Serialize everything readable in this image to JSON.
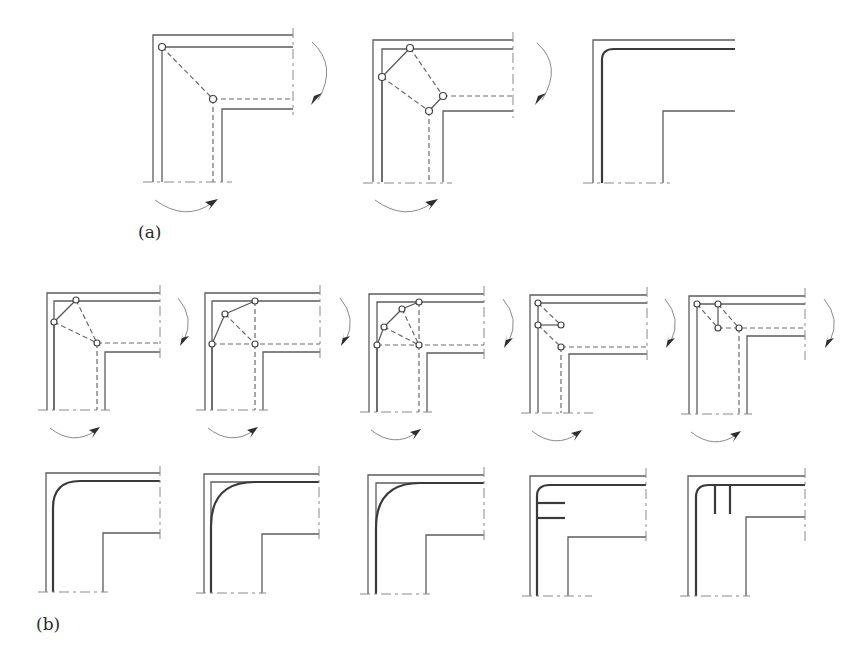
{
  "figure": {
    "labels": {
      "a": "(a)",
      "b": "(b)"
    },
    "colors": {
      "line": "#5c5c5c",
      "bold_line": "#3a3a3a",
      "background": "#ffffff"
    },
    "row_a": {
      "panels": [
        {
          "id": "a1",
          "type": "mechanism",
          "nodes": 2,
          "description": "single pivot linkage from outer corner to inner corner"
        },
        {
          "id": "a2",
          "type": "mechanism",
          "nodes": 4,
          "description": "four-node linkage around corner"
        },
        {
          "id": "a3",
          "type": "result",
          "description": "rounded corner profile"
        }
      ]
    },
    "row_b": {
      "mechanisms": [
        {
          "id": "b1",
          "nodes": 3
        },
        {
          "id": "b2",
          "nodes": 4
        },
        {
          "id": "b3",
          "nodes": 5
        },
        {
          "id": "b4",
          "nodes": 4
        },
        {
          "id": "b5",
          "nodes": 4
        }
      ],
      "results": [
        {
          "id": "b1r",
          "description": "rounded corner"
        },
        {
          "id": "b2r",
          "description": "quarter-circle fillet inside square corner"
        },
        {
          "id": "b3r",
          "description": "quarter-circle fillet inside square corner"
        },
        {
          "id": "b4r",
          "description": "rounded corner with two horizontal ribs"
        },
        {
          "id": "b5r",
          "description": "rounded corner with two vertical ribs"
        }
      ]
    }
  }
}
